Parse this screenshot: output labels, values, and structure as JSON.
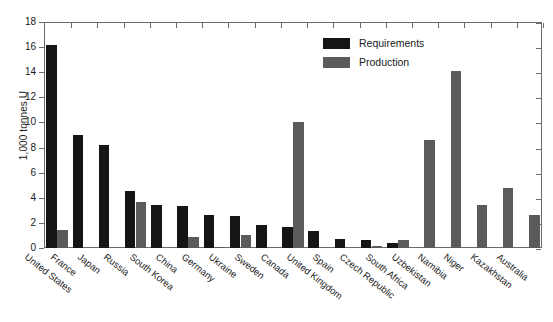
{
  "chart_data": {
    "type": "bar",
    "title": "",
    "subtitle": "",
    "xlabel": "",
    "ylabel": "1,000 tonnes U",
    "ylim": [
      0,
      18
    ],
    "ytick_step": 2,
    "yticks": [
      "0",
      "2",
      "4",
      "6",
      "8",
      "10",
      "12",
      "14",
      "16",
      "18"
    ],
    "grid": false,
    "legend_position": "top-right",
    "categories": [
      "United States",
      "France",
      "Japan",
      "Russia",
      "South Korea",
      "China",
      "Germany",
      "Ukraine",
      "Sweden",
      "Canada",
      "United Kingdom",
      "Spain",
      "Czech Republic",
      "South Africa",
      "Uzbekistan",
      "Namibia",
      "Niger",
      "Kazakhstan",
      "Australia"
    ],
    "series": [
      {
        "name": "Requirements",
        "color": "#151515",
        "values": [
          16.2,
          9.0,
          8.2,
          4.55,
          3.45,
          3.35,
          2.65,
          2.55,
          1.8,
          1.7,
          1.35,
          0.75,
          0.6,
          0.4,
          0,
          0,
          0,
          0,
          0
        ]
      },
      {
        "name": "Production",
        "color": "#5b5b5b",
        "values": [
          1.4,
          0,
          0,
          3.65,
          0,
          0.85,
          0.1,
          1.0,
          0,
          10.05,
          0,
          0,
          0.2,
          0.6,
          8.6,
          14.1,
          3.4,
          4.8,
          2.6
        ]
      }
    ]
  },
  "legend": {
    "items": [
      {
        "label": "Requirements",
        "color": "#151515"
      },
      {
        "label": "Production",
        "color": "#5b5b5b"
      }
    ]
  },
  "axes": {
    "y_title": "1,000 tonnes U"
  }
}
